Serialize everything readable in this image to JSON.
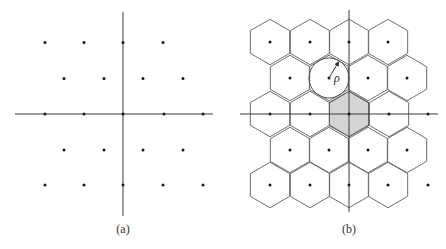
{
  "figure": {
    "panel_a": {
      "label": "(a)",
      "axes": {
        "horizontal": {
          "x1": 15,
          "x2": 213,
          "y": 114
        },
        "vertical": {
          "x": 123,
          "y1": 12,
          "y2": 216
        }
      },
      "lattice_points": [
        [
          45,
          42.5
        ],
        [
          84,
          42.5
        ],
        [
          123,
          42.5
        ],
        [
          163,
          42.5
        ],
        [
          64,
          78.5
        ],
        [
          104,
          78.5
        ],
        [
          143,
          78.5
        ],
        [
          183,
          78.5
        ],
        [
          45,
          114
        ],
        [
          84,
          114
        ],
        [
          123,
          114
        ],
        [
          164,
          114
        ],
        [
          203,
          114
        ],
        [
          64,
          150
        ],
        [
          104,
          150
        ],
        [
          143,
          150
        ],
        [
          183,
          150
        ],
        [
          45,
          185
        ],
        [
          84,
          185
        ],
        [
          123,
          185
        ],
        [
          163,
          185
        ],
        [
          203,
          185
        ]
      ]
    },
    "panel_b": {
      "label": "(b)",
      "symbol": "ρ",
      "axes": {
        "horizontal": {
          "x1": 240,
          "x2": 438,
          "y": 114
        },
        "vertical": {
          "x": 349,
          "y1": 10,
          "y2": 212
        }
      },
      "hex_circumradius": 22.7,
      "hex_cells": [
        [
          270,
          42
        ],
        [
          310,
          42
        ],
        [
          349,
          42
        ],
        [
          388,
          42
        ],
        [
          290,
          78
        ],
        [
          329,
          78
        ],
        [
          368,
          78
        ],
        [
          407,
          78
        ],
        [
          270,
          114
        ],
        [
          310,
          114
        ],
        [
          389,
          114
        ],
        [
          290,
          150
        ],
        [
          329,
          150
        ],
        [
          368,
          150
        ],
        [
          407,
          150
        ],
        [
          270,
          185
        ],
        [
          310,
          185
        ],
        [
          349,
          185
        ],
        [
          388,
          185
        ]
      ],
      "shaded_cell": [
        349,
        114
      ],
      "extra_points": [
        [
          428,
          114
        ],
        [
          428,
          185
        ]
      ],
      "packing_circle": {
        "cx": 329,
        "cy": 78,
        "r": 20
      },
      "radius_arrow": {
        "x1": 329,
        "y1": 78,
        "x2": 338.5,
        "y2": 62
      },
      "rho_label_pos": [
        334,
        82
      ]
    }
  }
}
